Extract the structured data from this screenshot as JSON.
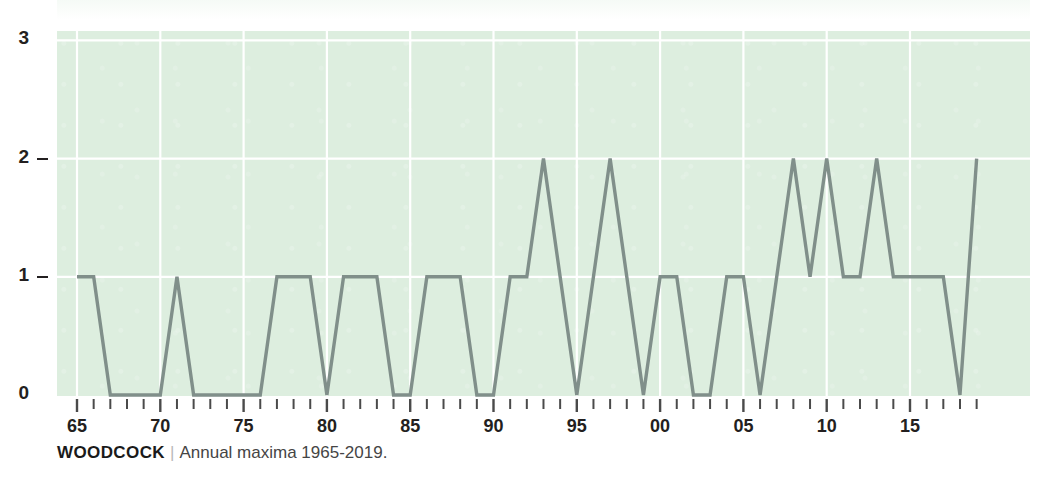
{
  "caption": {
    "source": "WOODCOCK",
    "separator": "|",
    "description": "Annual maxima 1965-2019."
  },
  "chart_data": {
    "type": "line",
    "title": "",
    "subtitle": "",
    "xlabel": "",
    "ylabel": "",
    "ylim": [
      0,
      3
    ],
    "xlim": [
      1965,
      2019
    ],
    "yticks": [
      0,
      1,
      2,
      3
    ],
    "ytick_labels": [
      "0",
      "1",
      "2",
      "3"
    ],
    "xticks": [
      1965,
      1970,
      1975,
      1980,
      1985,
      1990,
      1995,
      2000,
      2005,
      2010,
      2015
    ],
    "xtick_labels": [
      "65",
      "70",
      "75",
      "80",
      "85",
      "90",
      "95",
      "00",
      "05",
      "10",
      "15"
    ],
    "minor_xticks_every": 1,
    "grid": true,
    "grid_axis": "both",
    "legend": false,
    "line_color": "#808f8a",
    "plot_background": "#ddeedf",
    "grid_color": "#ffffff",
    "x": [
      1965,
      1966,
      1967,
      1968,
      1969,
      1970,
      1971,
      1972,
      1973,
      1974,
      1975,
      1976,
      1977,
      1978,
      1979,
      1980,
      1981,
      1982,
      1983,
      1984,
      1985,
      1986,
      1987,
      1988,
      1989,
      1990,
      1991,
      1992,
      1993,
      1994,
      1995,
      1996,
      1997,
      1998,
      1999,
      2000,
      2001,
      2002,
      2003,
      2004,
      2005,
      2006,
      2007,
      2008,
      2009,
      2010,
      2011,
      2012,
      2013,
      2014,
      2015,
      2016,
      2017,
      2018,
      2019
    ],
    "values": [
      1,
      1,
      0,
      0,
      0,
      0,
      1,
      0,
      0,
      0,
      0,
      0,
      1,
      1,
      1,
      0,
      1,
      1,
      1,
      0,
      0,
      1,
      1,
      1,
      0,
      0,
      1,
      1,
      2,
      1,
      0,
      1,
      2,
      1,
      0,
      1,
      1,
      0,
      0,
      1,
      1,
      0,
      1,
      2,
      1,
      2,
      1,
      1,
      2,
      1,
      1,
      1,
      1,
      0,
      2
    ]
  }
}
